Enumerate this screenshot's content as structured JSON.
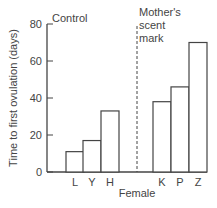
{
  "chart_data": {
    "type": "bar",
    "title": "",
    "xlabel": "Female",
    "ylabel": "Time to first ovulation (days)",
    "ylim": [
      0,
      80
    ],
    "yticks": [
      0,
      20,
      40,
      60,
      80
    ],
    "grid": false,
    "categories": [
      "L",
      "Y",
      "H",
      "K",
      "P",
      "Z"
    ],
    "values": [
      11,
      17,
      33,
      38,
      46,
      70
    ],
    "groups": [
      {
        "name": "Control",
        "categories": [
          "L",
          "Y",
          "H"
        ],
        "values": [
          11,
          17,
          33
        ]
      },
      {
        "name": "Mother's scent mark",
        "categories": [
          "K",
          "P",
          "Z"
        ],
        "values": [
          38,
          46,
          70
        ]
      }
    ],
    "annotations": [
      "Control",
      "Mother's scent mark"
    ],
    "divider": "dashed vertical line separating Control and Mother's scent mark groups"
  },
  "labels": {
    "control": "Control",
    "scent_line1": "Mother's",
    "scent_line2": "scent",
    "scent_line3": "mark",
    "xlabel": "Female",
    "ylabel": "Time to first ovulation (days)"
  }
}
